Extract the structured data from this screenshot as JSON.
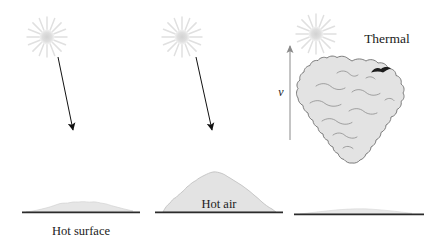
{
  "figure": {
    "background_color": "#ffffff",
    "panels": [
      {
        "id": "panel-1",
        "stage_label": "Hot surface",
        "description": "Sun heats the ground, low flat layer of warm air forms"
      },
      {
        "id": "panel-2",
        "stage_label": "Hot air",
        "description": "Warm air accumulates into a dome"
      },
      {
        "id": "panel-3",
        "stage_label": "Thermal",
        "description": "Bubble detaches and rises as a thermal"
      }
    ]
  },
  "labels": {
    "hot_surface": "Hot surface",
    "hot_air": "Hot air",
    "thermal": "Thermal",
    "velocity": "v"
  },
  "icons": {
    "sun": "sun-starburst-icon",
    "ray_arrow": "solar-ray-arrow-icon",
    "velocity_arrow": "upward-velocity-arrow-icon",
    "bird": "bird-silhouette-icon"
  },
  "colors": {
    "sun_fill": "#d9d9d9",
    "sun_rays": "#e2e2e2",
    "air_fill": "#e3e3e3",
    "air_outline": "#777777",
    "ground_line": "#2b2b2b",
    "arrow": "#111111",
    "velocity_arrow": "#8a8a8a",
    "text": "#1b1b1b"
  },
  "geometry": {
    "sun_positions": [
      [
        47,
        37
      ],
      [
        182,
        37
      ],
      [
        316,
        34
      ]
    ],
    "ray_arrows": [
      {
        "from": [
          58,
          57
        ],
        "to": [
          74,
          132
        ]
      },
      {
        "from": [
          195,
          57
        ],
        "to": [
          213,
          132
        ]
      }
    ],
    "velocity_arrow": {
      "from": [
        290,
        140
      ],
      "to": [
        290,
        44
      ]
    },
    "ground_lines": [
      {
        "x1": 22,
        "x2": 140,
        "y": 212
      },
      {
        "x1": 155,
        "x2": 283,
        "y": 212
      },
      {
        "x1": 294,
        "x2": 424,
        "y": 214
      }
    ]
  }
}
